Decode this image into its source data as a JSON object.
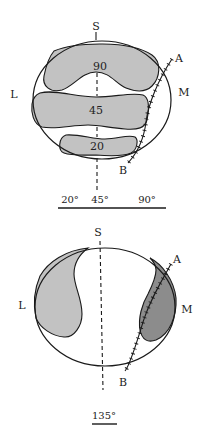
{
  "colors": {
    "outline": "#1a1a1a",
    "light_fill": "#c2c2c2",
    "dark_fill": "#8c8c8c",
    "background": "#ffffff"
  },
  "top_panel": {
    "label_superior": "S",
    "label_lateral": "L",
    "label_medial": "M",
    "label_a": "A",
    "label_b": "B",
    "regions": [
      {
        "label": "90"
      },
      {
        "label": "45"
      },
      {
        "label": "20"
      }
    ],
    "axis": {
      "ticks": [
        "20°",
        "45°",
        "90°"
      ]
    }
  },
  "bottom_panel": {
    "label_superior": "S",
    "label_lateral": "L",
    "label_medial": "M",
    "label_a": "A",
    "label_b": "B",
    "caption": "135°"
  }
}
